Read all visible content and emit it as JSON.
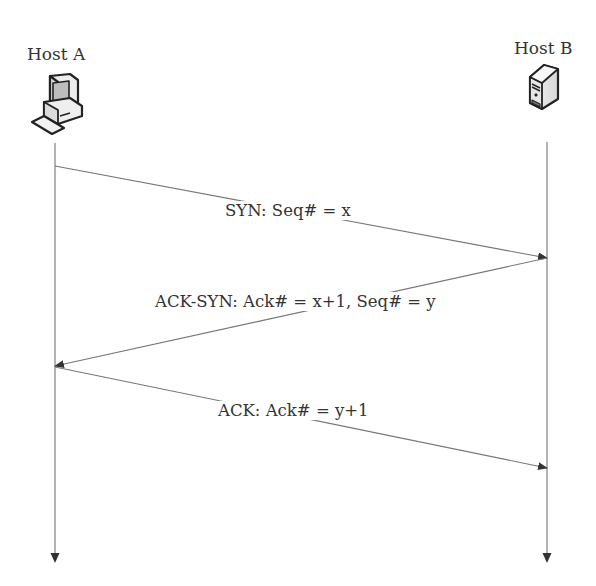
{
  "diagram": {
    "type": "sequence",
    "title": "",
    "hosts": [
      {
        "id": "A",
        "label": "Host A",
        "icon": "desktop-computer-icon",
        "x": 55
      },
      {
        "id": "B",
        "label": "Host B",
        "icon": "server-icon",
        "x": 547
      }
    ],
    "messages": [
      {
        "from": "A",
        "to": "B",
        "label": "SYN: Seq# = x",
        "y_start": 166,
        "y_end": 258
      },
      {
        "from": "B",
        "to": "A",
        "label": "ACK-SYN: Ack# = x+1, Seq# = y",
        "y_start": 258,
        "y_end": 366
      },
      {
        "from": "A",
        "to": "B",
        "label": "ACK: Ack# = y+1",
        "y_start": 367,
        "y_end": 468
      }
    ],
    "colors": {
      "line": "#8a8a8a",
      "arrowhead": "#333333",
      "text": "#333333",
      "background": "#ffffff"
    }
  }
}
